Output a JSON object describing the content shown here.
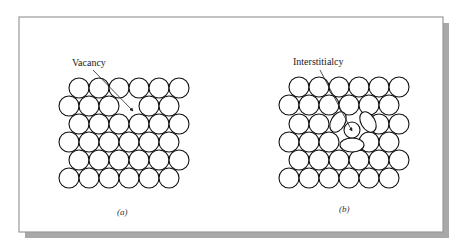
{
  "figure": {
    "frame": {
      "x": 19,
      "y": 17,
      "width": 424,
      "height": 215,
      "border_color": "#9a9a9a",
      "shadow_color": "#a8a8a8",
      "shadow_offset": 6
    },
    "panels": [
      {
        "id": "a",
        "label": "Vacancy",
        "label_pos": {
          "x": 72,
          "y": 66
        },
        "caption": "(a)",
        "caption_pos": {
          "x": 117,
          "y": 215
        },
        "arrow": {
          "x1": 93,
          "y1": 70,
          "x2": 133,
          "y2": 111
        },
        "radius": 10,
        "spacing": 20,
        "rows": [
          {
            "y": 88,
            "x0": 79,
            "count": 6,
            "skip": []
          },
          {
            "y": 106,
            "x0": 69,
            "count": 6,
            "skip": [
              3
            ]
          },
          {
            "y": 124,
            "x0": 79,
            "count": 6,
            "skip": []
          },
          {
            "y": 142,
            "x0": 69,
            "count": 6,
            "skip": []
          },
          {
            "y": 160,
            "x0": 79,
            "count": 6,
            "skip": []
          },
          {
            "y": 178,
            "x0": 69,
            "count": 6,
            "skip": []
          }
        ],
        "defect": "vacancy"
      },
      {
        "id": "b",
        "label": "Interstitialcy",
        "label_pos": {
          "x": 293,
          "y": 65
        },
        "caption": "(b)",
        "caption_pos": {
          "x": 339,
          "y": 212
        },
        "arrow": {
          "x1": 320,
          "y1": 70,
          "x2": 352,
          "y2": 131
        },
        "radius": 10,
        "spacing": 20,
        "rows": [
          {
            "y": 87,
            "x0": 299,
            "count": 6,
            "skip": []
          },
          {
            "y": 105,
            "x0": 289,
            "count": 6,
            "skip": []
          },
          {
            "y": 124,
            "x0": 299,
            "count": 6,
            "skip": [
              2,
              3
            ]
          },
          {
            "y": 142,
            "x0": 289,
            "count": 6,
            "skip": [
              3
            ]
          },
          {
            "y": 160,
            "x0": 299,
            "count": 6,
            "skip": []
          },
          {
            "y": 178,
            "x0": 289,
            "count": 6,
            "skip": []
          }
        ],
        "interstitial": {
          "cx": 352,
          "cy": 130,
          "r": 8
        },
        "distorted": [
          {
            "cx": 338,
            "cy": 122,
            "rx": 11,
            "ry": 7,
            "rot": -60
          },
          {
            "cx": 368,
            "cy": 122,
            "rx": 11,
            "ry": 7,
            "rot": 60
          },
          {
            "cx": 352,
            "cy": 145,
            "rx": 12,
            "ry": 7,
            "rot": 0
          }
        ],
        "defect": "interstitialcy"
      }
    ]
  }
}
